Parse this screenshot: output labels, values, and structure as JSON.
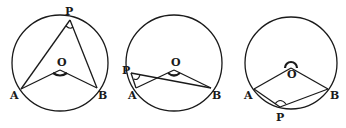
{
  "figures": [
    {
      "name": "figure-1",
      "case": "P on major arc, center O inside angle APB",
      "labels": {
        "P": "P",
        "O": "O",
        "A": "A",
        "B": "B"
      }
    },
    {
      "name": "figure-2",
      "case": "P on major arc, center O outside angle APB",
      "labels": {
        "P": "P",
        "O": "O",
        "A": "A",
        "B": "B"
      }
    },
    {
      "name": "figure-3",
      "case": "P on minor arc, reflex angle AOB",
      "labels": {
        "P": "P",
        "O": "O",
        "A": "A",
        "B": "B"
      }
    }
  ]
}
